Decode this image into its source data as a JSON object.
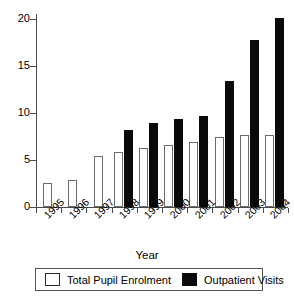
{
  "chart_data": {
    "type": "bar",
    "title": "",
    "subtitle": "",
    "xlabel": "Year",
    "ylabel": "",
    "categories": [
      "1995",
      "1996",
      "1997",
      "1998",
      "1999",
      "2000",
      "2001",
      "2002",
      "2003",
      "2004"
    ],
    "series": [
      {
        "name": "Total Pupil Enrolment",
        "color": "#ffffff",
        "edge_color": "#6b6b6b",
        "values": [
          2.6,
          2.9,
          5.4,
          5.8,
          6.3,
          6.6,
          6.9,
          7.4,
          7.7,
          7.6
        ]
      },
      {
        "name": "Outpatient Visits",
        "color": "#0a0a0a",
        "edge_color": "#0a0a0a",
        "values": [
          null,
          null,
          null,
          8.2,
          8.9,
          9.4,
          9.7,
          13.4,
          17.7,
          20.1
        ]
      }
    ],
    "ylim": [
      0,
      20.5
    ],
    "yticks": [
      0,
      5,
      10,
      15,
      20
    ],
    "ytick_labels": [
      "0",
      "5",
      "10",
      "15",
      "20"
    ],
    "grid": false,
    "legend_position": "bottom",
    "xtick_rotation": -45
  },
  "legend": {
    "entries": [
      {
        "label": "Total Pupil Enrolment",
        "swatch": "white-square"
      },
      {
        "label": "Outpatient Visits",
        "swatch": "black-square"
      }
    ]
  },
  "axes": {
    "x_title": "Year"
  }
}
